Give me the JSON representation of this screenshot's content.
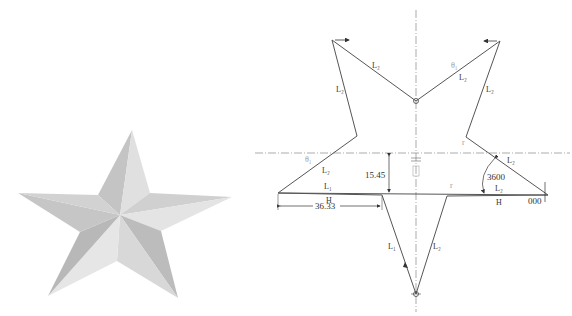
{
  "figure": {
    "left_panel": {
      "description": "shaded 3D five-pointed star",
      "colors": {
        "light": "#e4e4e4",
        "mid": "#cfcfcf",
        "dark": "#b4b4b4"
      }
    },
    "right_panel": {
      "description": "unfolded / flat pattern drawing of star with dimensions",
      "edge_labels": {
        "top_left_outer": "L₂",
        "top_left_inner": "L₂",
        "top_right_inner": "L₂",
        "top_right_outer": "L₂",
        "left_upper": "L₂",
        "left_lower": "L₁",
        "right_upper": "L₂",
        "right_lower": "L₂",
        "bottom_left": "L₁",
        "bottom_right": "L₂"
      },
      "angle_marks": {
        "top_right": "θ₁",
        "left": "θ₁"
      },
      "dimensions": {
        "height_offset": "15.45",
        "half_width": "36.33",
        "angle": "3600",
        "right_end": "000",
        "baseline_left": "H",
        "baseline_right": "H"
      },
      "colors": {
        "line": "#555555",
        "centerline": "#888888"
      }
    }
  }
}
